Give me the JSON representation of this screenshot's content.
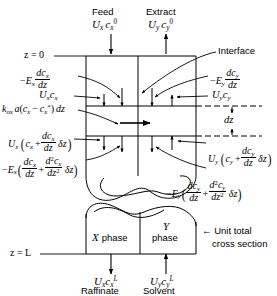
{
  "figure": {
    "background_color": "#ffffff",
    "line_color": "#000000"
  },
  "top_stream_labels": {
    "feed": "Feed",
    "extract": "Extract"
  },
  "axial_positions": {
    "top": "z = 0",
    "bottom": "z = L"
  },
  "callouts": {
    "interface": "Interface",
    "unit_cross_section_line1": "← Unit total",
    "unit_cross_section_line2": "cross section",
    "element_height": "dz"
  },
  "phase_boxes": {
    "x_phase_symbol": "X",
    "x_phase_word": "phase",
    "y_phase_symbol": "Y",
    "y_phase_word": "phase"
  },
  "bottom_stream_labels": {
    "raffinate": "Raffinate",
    "solvent": "Solvent"
  },
  "flux_terms": {
    "feed_in": {
      "U": "U",
      "U_sub": "x",
      "c": "c",
      "c_sub": "x",
      "c_sup": "0"
    },
    "extract_out": {
      "U": "U",
      "U_sub": "y",
      "c": "c",
      "c_sub": "y",
      "c_sup": "0"
    },
    "raffinate_out": {
      "U": "U",
      "U_sub": "x",
      "c": "c",
      "c_sub": "x",
      "c_sup": "L"
    },
    "solvent_in": {
      "U": "U",
      "U_sub": "y",
      "c": "c",
      "c_sub": "y",
      "c_sup": "L"
    },
    "x_diffusion_top": {
      "sign": "−",
      "E": "E",
      "E_sub": "x",
      "num": "dc",
      "num_sub": "x",
      "den": "dz"
    },
    "y_diffusion_top": {
      "sign": "−",
      "E": "E",
      "E_sub": "y",
      "num": "dc",
      "num_sub": "y",
      "den": "dz"
    },
    "x_convection_top": {
      "U": "U",
      "U_sub": "x",
      "c": "c",
      "c_sub": "x"
    },
    "y_convection_top": {
      "U": "U",
      "U_sub": "y",
      "c": "c",
      "c_sub": "y"
    },
    "mass_transfer": {
      "k": "k",
      "k_sub": "ox",
      "a": "a",
      "open": "(",
      "c1": "c",
      "c1_sub": "x",
      "minus": "−",
      "c2": "c",
      "c2_sub": "x",
      "c2_sup": "*",
      "close": ")",
      "dz": "dz"
    },
    "x_convection_bottom": {
      "U": "U",
      "U_sub": "x",
      "c": "c",
      "c_sub": "x",
      "plus": "+",
      "num": "dc",
      "num_sub": "x",
      "den": "dz",
      "delta": "δz"
    },
    "y_convection_bottom": {
      "U": "U",
      "U_sub": "y",
      "c": "c",
      "c_sub": "y",
      "plus": "+",
      "num": "dc",
      "num_sub": "y",
      "den": "dz",
      "delta": "δz"
    },
    "x_diffusion_bottom": {
      "sign": "−",
      "E": "E",
      "E_sub": "x",
      "num1": "dc",
      "num1_sub": "x",
      "den1": "dz",
      "plus": "+",
      "num2": "d",
      "num2_sup": "2",
      "num2_c": "c",
      "num2_sub": "x",
      "den2": "dz",
      "den2_sup": "2",
      "delta": "δz"
    },
    "y_diffusion_bottom": {
      "sign": "−",
      "E": "E",
      "E_sub": "y",
      "num1": "dc",
      "num1_sub": "y",
      "den1": "dz",
      "plus": "+",
      "num2": "d",
      "num2_sup": "2",
      "num2_c": "c",
      "num2_sub": "y",
      "den2": "dz",
      "den2_sup": "2",
      "delta": "δz"
    }
  }
}
